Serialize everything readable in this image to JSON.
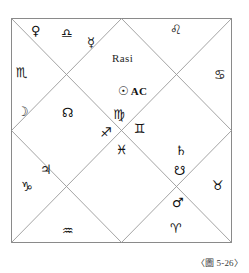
{
  "figure": {
    "title": "Rasi",
    "caption": "〈圖 5-26〉",
    "border_color": "#8a8a8a",
    "line_color": "#9a9a9a",
    "ink_color": "#111111"
  },
  "ascendant": {
    "sun_glyph": "☉",
    "label": "AC"
  },
  "signs": [
    {
      "name": "libra",
      "glyph": "♎",
      "x": 61,
      "y": 27
    },
    {
      "name": "leo",
      "glyph": "♌",
      "x": 170,
      "y": 23
    },
    {
      "name": "scorpio",
      "glyph": "♏",
      "x": 16,
      "y": 66
    },
    {
      "name": "cancer",
      "glyph": "♋",
      "x": 214,
      "y": 68
    },
    {
      "name": "rahu-node",
      "glyph": "☊",
      "x": 62,
      "y": 106
    },
    {
      "name": "virgo",
      "glyph": "♍",
      "x": 113,
      "y": 108
    },
    {
      "name": "sagittarius",
      "glyph": "♐",
      "x": 100,
      "y": 126
    },
    {
      "name": "gemini",
      "glyph": "♊",
      "x": 134,
      "y": 122
    },
    {
      "name": "pisces",
      "glyph": "♓",
      "x": 116,
      "y": 143
    },
    {
      "name": "taurus",
      "glyph": "♉",
      "x": 212,
      "y": 179
    },
    {
      "name": "capricorn",
      "glyph": "♑",
      "x": 21,
      "y": 180
    },
    {
      "name": "aquarius",
      "glyph": "♒",
      "x": 62,
      "y": 224
    },
    {
      "name": "aries",
      "glyph": "♈",
      "x": 170,
      "y": 222
    }
  ],
  "planets": [
    {
      "name": "venus",
      "glyph": "♀",
      "x": 31,
      "y": 24
    },
    {
      "name": "mercury",
      "glyph": "☿",
      "x": 87,
      "y": 36
    },
    {
      "name": "moon",
      "glyph": "☽",
      "x": 17,
      "y": 105
    },
    {
      "name": "saturn",
      "glyph": "♄",
      "x": 175,
      "y": 144
    },
    {
      "name": "ketu",
      "glyph": "☋",
      "x": 174,
      "y": 164
    },
    {
      "name": "mars",
      "glyph": "♂",
      "x": 172,
      "y": 196
    },
    {
      "name": "jupiter",
      "glyph": "♃",
      "x": 40,
      "y": 163
    }
  ],
  "geometry": {
    "box": {
      "left": 11,
      "top": 18,
      "right": 232,
      "bottom": 243
    },
    "title_pos": {
      "x": 112,
      "y": 52
    },
    "ascendant_pos": {
      "x": 118,
      "y": 84
    }
  }
}
